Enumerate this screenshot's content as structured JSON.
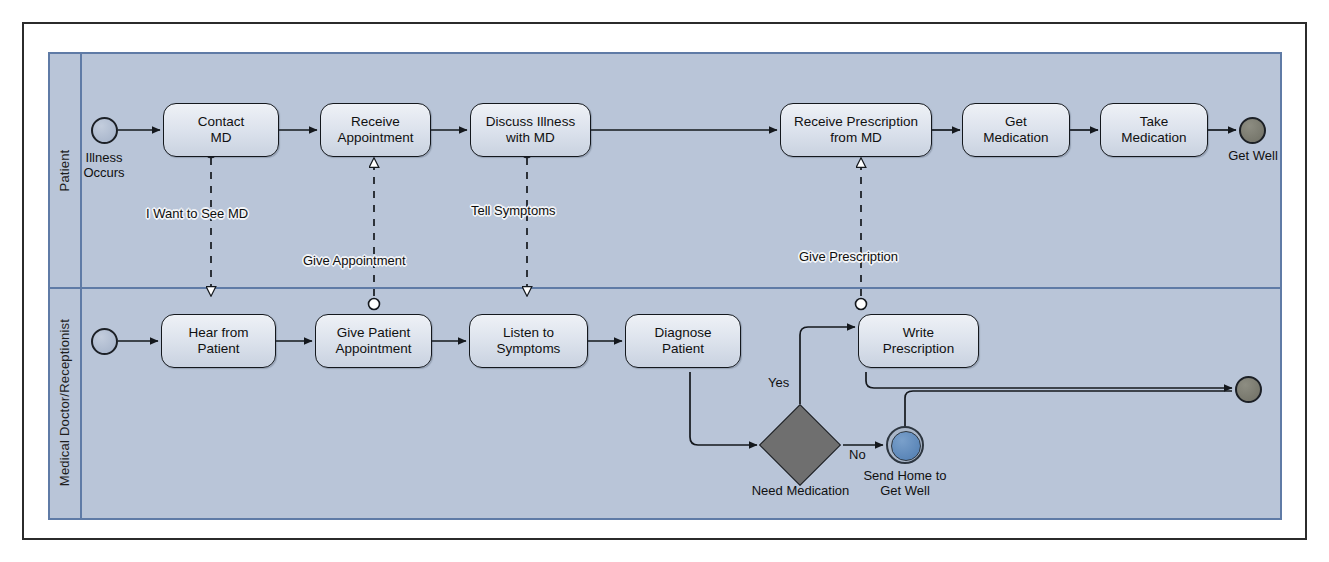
{
  "diagram": {
    "type": "bpmn-collaboration",
    "pool_label": "",
    "lanes": [
      {
        "id": "patient",
        "label": "Patient"
      },
      {
        "id": "md",
        "label": "Medical Doctor/Receptionist"
      }
    ],
    "colors": {
      "pool_background": "#b9c5d8",
      "pool_border": "#5f7ba6",
      "task_fill": "#dde3ed",
      "task_border": "#14181d",
      "start_event_fill": "#a3b1c8",
      "end_event_fill": "#6f6f64",
      "intermediate_event_fill": "#4f7cb0",
      "gateway_fill": "#6f6f6f",
      "frame_border": "#2b2b2b"
    }
  },
  "patient_lane": {
    "start_event": {
      "name": "start-event-illness",
      "caption": "Illness\nOccurs",
      "caption_line1": "Illness",
      "caption_line2": "Occurs"
    },
    "tasks": [
      {
        "id": "contact-md",
        "label_line1": "Contact",
        "label_line2": "MD"
      },
      {
        "id": "receive-appointment",
        "label_line1": "Receive",
        "label_line2": "Appointment"
      },
      {
        "id": "discuss-illness",
        "label_line1": "Discuss Illness",
        "label_line2": "with MD"
      },
      {
        "id": "receive-prescription",
        "label_line1": "Receive Prescription",
        "label_line2": "from MD"
      },
      {
        "id": "get-medication",
        "label_line1": "Get",
        "label_line2": "Medication"
      },
      {
        "id": "take-medication",
        "label_line1": "Take",
        "label_line2": "Medication"
      }
    ],
    "end_event": {
      "name": "end-event-get-well",
      "caption": "Get Well"
    }
  },
  "md_lane": {
    "start_event": {
      "name": "start-event-md",
      "caption": ""
    },
    "tasks": [
      {
        "id": "hear-from-patient",
        "label_line1": "Hear from",
        "label_line2": "Patient"
      },
      {
        "id": "give-patient-appointment",
        "label_line1": "Give Patient",
        "label_line2": "Appointment"
      },
      {
        "id": "listen-to-symptoms",
        "label_line1": "Listen to",
        "label_line2": "Symptoms"
      },
      {
        "id": "diagnose-patient",
        "label_line1": "Diagnose",
        "label_line2": "Patient"
      },
      {
        "id": "write-prescription",
        "label_line1": "Write",
        "label_line2": "Prescription"
      }
    ],
    "gateway": {
      "id": "need-medication",
      "label": "Need Medication",
      "kind": "exclusive"
    },
    "gateway_flows": [
      {
        "id": "flow-yes",
        "label": "Yes",
        "target": "write-prescription"
      },
      {
        "id": "flow-no",
        "label": "No",
        "target": "send-home"
      }
    ],
    "intermediate_event": {
      "id": "send-home",
      "caption_line1": "Send Home to",
      "caption_line2": "Get Well"
    },
    "end_event": {
      "name": "end-event-md",
      "caption": ""
    }
  },
  "message_flows": [
    {
      "id": "msg-i-want-to-see-md",
      "label": "I Want to See MD",
      "from": "contact-md",
      "to": "hear-from-patient",
      "direction": "down"
    },
    {
      "id": "msg-give-appointment",
      "label": "Give Appointment",
      "from": "give-patient-appointment",
      "to": "receive-appointment",
      "direction": "up"
    },
    {
      "id": "msg-tell-symptoms",
      "label": "Tell Symptoms",
      "from": "discuss-illness",
      "to": "listen-to-symptoms",
      "direction": "down"
    },
    {
      "id": "msg-give-prescription",
      "label": "Give Prescription",
      "from": "write-prescription",
      "to": "receive-prescription",
      "direction": "up"
    }
  ]
}
